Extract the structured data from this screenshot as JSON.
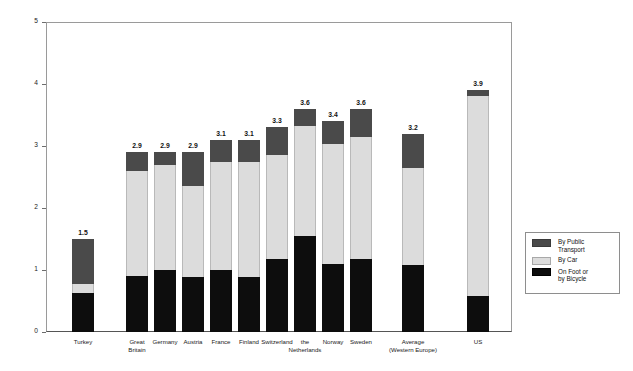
{
  "chart_data": {
    "type": "bar",
    "subtype": "stacked-vertical",
    "title": "",
    "xlabel": "",
    "ylabel": "Number of Trips per Day per Person",
    "ylim": [
      0,
      5
    ],
    "yticks": [
      "0",
      "1",
      "2",
      "3",
      "4",
      "5"
    ],
    "grid": false,
    "legend_position": "right-outside",
    "categories": [
      "Turkey",
      "Great\nBritain",
      "Germany",
      "Austria",
      "France",
      "Finland",
      "Switzerland",
      "the\nNetherlands",
      "Norway",
      "Sweden",
      "Average\n(Western Europe)",
      "US"
    ],
    "series": [
      {
        "name": "On Foot or\nby Bicycle",
        "color": "#0d0d0d",
        "values": [
          0.63,
          0.9,
          1.0,
          0.88,
          1.0,
          0.88,
          1.17,
          1.55,
          1.1,
          1.18,
          1.08,
          0.58
        ]
      },
      {
        "name": "By Car",
        "color": "#dcdcdc",
        "values": [
          0.15,
          1.7,
          1.7,
          1.47,
          1.75,
          1.87,
          1.68,
          1.78,
          1.93,
          1.97,
          1.57,
          3.22
        ]
      },
      {
        "name": "By Public\nTransport",
        "color": "#4a4a4a",
        "values": [
          0.72,
          0.3,
          0.2,
          0.55,
          0.35,
          0.35,
          0.45,
          0.27,
          0.37,
          0.45,
          0.55,
          0.1
        ]
      }
    ],
    "totals": [
      "1.5",
      "2.9",
      "2.9",
      "2.9",
      "3.1",
      "3.1",
      "3.3",
      "3.6",
      "3.4",
      "3.6",
      "3.2",
      "3.9"
    ]
  },
  "legend": {
    "items": [
      {
        "label": "By Public\nTransport",
        "color": "#4a4a4a",
        "key": "transport"
      },
      {
        "label": "By Car",
        "color": "#dcdcdc",
        "key": "car"
      },
      {
        "label": "On Foot or\nby Bicycle",
        "color": "#0d0d0d",
        "key": "foot"
      }
    ]
  }
}
